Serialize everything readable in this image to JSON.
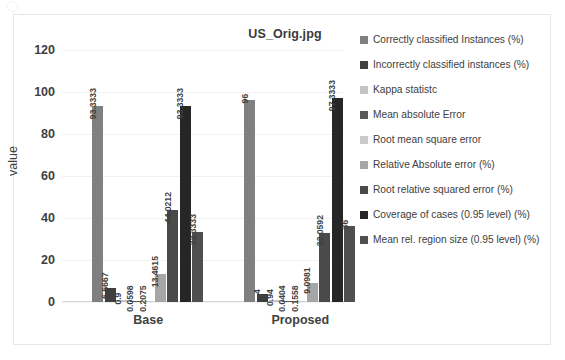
{
  "chart_data": {
    "type": "bar",
    "title": "US_Orig.jpg",
    "xlabel": "",
    "ylabel": "value",
    "ylim": [
      0,
      120
    ],
    "yticks": [
      0,
      20,
      40,
      60,
      80,
      100,
      120
    ],
    "grid": true,
    "legend_position": "right",
    "categories": [
      "Base",
      "Proposed"
    ],
    "series": [
      {
        "name": "Correctly classified Instances (%)",
        "color": "#808080",
        "values": [
          93.3333,
          96
        ],
        "labels": [
          "93.3333",
          "96"
        ]
      },
      {
        "name": "Incorrectly classified instances (%)",
        "color": "#3f3f3f",
        "values": [
          6.6667,
          4
        ],
        "labels": [
          "6.6667",
          "4"
        ]
      },
      {
        "name": "Kappa statistc",
        "color": "#c4c4c4",
        "values": [
          0.9,
          0.94
        ],
        "labels": [
          "0.9",
          "0.94"
        ]
      },
      {
        "name": "Mean absolute Error",
        "color": "#595959",
        "values": [
          0.0598,
          0.0404
        ],
        "labels": [
          "0.0598",
          "0.0404"
        ]
      },
      {
        "name": "Root mean square error",
        "color": "#c9c9c9",
        "values": [
          0.2075,
          0.1558
        ],
        "labels": [
          "0.2075",
          "0.1558"
        ]
      },
      {
        "name": "Relative Absolute error (%)",
        "color": "#a6a6a6",
        "values": [
          13.4615,
          9.0981
        ],
        "labels": [
          "13.4615",
          "9.0981"
        ]
      },
      {
        "name": "Root relative squared error (%)",
        "color": "#4a4a4a",
        "values": [
          44.0212,
          33.0592
        ],
        "labels": [
          "44.0212",
          "33.0592"
        ]
      },
      {
        "name": "Coverage of cases (0.95 level) (%)",
        "color": "#262626",
        "values": [
          93.3333,
          97.3333
        ],
        "labels": [
          "93.3333",
          "97.3333"
        ]
      },
      {
        "name": "Mean rel. region size (0.95 level) (%)",
        "color": "#4f4f4f",
        "values": [
          33.3333,
          36
        ],
        "labels": [
          "33.3333",
          "36"
        ]
      }
    ]
  },
  "legend": {
    "items": [
      "Correctly classified Instances (%)",
      "Incorrectly classified instances (%)",
      "Kappa statistc",
      "Mean absolute Error",
      "Root mean square error",
      "Relative Absolute error (%)",
      "Root relative squared error (%)",
      "Coverage of cases (0.95 level) (%)",
      "Mean rel. region size (0.95 level) (%)"
    ]
  }
}
